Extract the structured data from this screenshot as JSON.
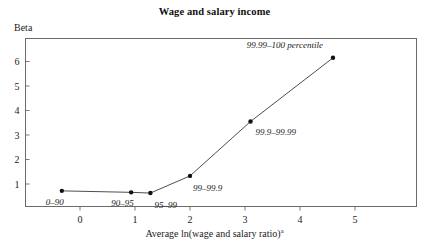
{
  "chart_data": {
    "type": "line",
    "title": "Wage and salary income",
    "xlabel": "Average ln(wage and salary ratio)",
    "xlabel_superscript": "a",
    "ylabel": "Beta",
    "xlim": [
      -1.0,
      6.1
    ],
    "ylim": [
      0.0,
      6.9
    ],
    "xticks": [
      "0",
      "1",
      "2",
      "3",
      "4",
      "5"
    ],
    "xtick_values": [
      0,
      1,
      2,
      3,
      4,
      5
    ],
    "yticks": [
      "1",
      "2",
      "3",
      "4",
      "5",
      "6"
    ],
    "ytick_values": [
      1,
      2,
      3,
      4,
      5,
      6
    ],
    "grid": false,
    "legend": "none",
    "x": [
      -0.33,
      0.93,
      1.28,
      2.0,
      3.1,
      4.6
    ],
    "y": [
      0.72,
      0.66,
      0.63,
      1.33,
      3.55,
      6.15
    ],
    "point_labels": [
      "0–90",
      "90–95",
      "95–99",
      "99–99.9",
      "99.9–99.99",
      "99.99–100 percentile"
    ],
    "points": [
      {
        "label": "0–90",
        "x": -0.33,
        "y": 0.72
      },
      {
        "label": "90–95",
        "x": 0.93,
        "y": 0.66
      },
      {
        "label": "95–99",
        "x": 1.28,
        "y": 0.63
      },
      {
        "label": "99–99.9",
        "x": 2.0,
        "y": 1.33
      },
      {
        "label": "99.9–99.99",
        "x": 3.1,
        "y": 3.55
      },
      {
        "label": "99.99–100 percentile",
        "x": 4.6,
        "y": 6.15
      }
    ],
    "colors": {
      "line": "#3a3a3a",
      "marker": "#111111",
      "frame": "#6b6b6b",
      "text": "#1a1a1a",
      "background": "#ffffff"
    }
  }
}
